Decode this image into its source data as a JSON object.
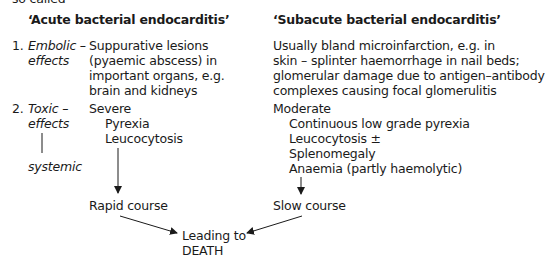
{
  "intro_fragment": "so called",
  "acute": {
    "heading": "‘Acute bacterial endocarditis’",
    "items": [
      {
        "number": "1.",
        "label_lines": [
          "Embolic –",
          "effects"
        ],
        "desc_lines": [
          "Suppurative lesions",
          "(pyaemic abscess) in",
          "important organs, e.g.",
          "brain and kidneys"
        ]
      },
      {
        "number": "2.",
        "label_lines": [
          "Toxic –",
          "effects"
        ],
        "sublabel": "systemic",
        "severity": "Severe",
        "symptoms": [
          "Pyrexia",
          "Leucocytosis"
        ]
      }
    ],
    "outcome": "Rapid course"
  },
  "subacute": {
    "heading": "‘Subacute bacterial endocarditis’",
    "embolic_lines": [
      "Usually bland microinfarction, e.g. in",
      "skin – splinter haemorrhage in nail beds;",
      "glomerular damage due to antigen–antibody",
      "complexes causing focal glomerulitis"
    ],
    "severity": "Moderate",
    "symptoms": [
      "Continuous low grade pyrexia",
      "Leucocytosis ±",
      "Splenomegaly",
      "Anaemia (partly haemolytic)"
    ],
    "outcome": "Slow course"
  },
  "final": {
    "lines": [
      "Leading to",
      "DEATH"
    ]
  }
}
